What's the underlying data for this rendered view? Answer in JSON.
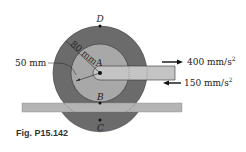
{
  "figure": {
    "caption": "Fig. P15.142",
    "labels": {
      "point_D": "D",
      "point_A": "A",
      "point_B": "B",
      "point_C": "C",
      "outer_radius": "80 mm",
      "inner_radius": "50 mm",
      "accel_right": "400 mm/s",
      "accel_right_exp": "2",
      "accel_left": "150 mm/s",
      "accel_left_exp": "2"
    },
    "colors": {
      "outer_disk": "#6b6b6b",
      "inner_disk": "#a8a8a8",
      "rail": "#b4b4b4",
      "arm": "#c4c4c4",
      "ink": "#222222"
    }
  }
}
